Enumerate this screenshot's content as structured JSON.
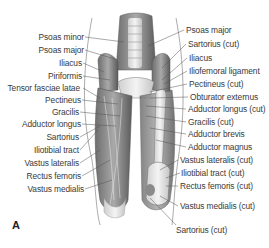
{
  "figure": {
    "panel_label": "A",
    "left_labels": [
      {
        "text": "Psoas minor",
        "y": 37
      },
      {
        "text": "Psoas major",
        "y": 50
      },
      {
        "text": "Iliacus",
        "y": 63
      },
      {
        "text": "Piriformis",
        "y": 76
      },
      {
        "text": "Tensor fasciae latae",
        "y": 88
      },
      {
        "text": "Pectineus",
        "y": 100
      },
      {
        "text": "Gracilis",
        "y": 112
      },
      {
        "text": "Adductor longus",
        "y": 124
      },
      {
        "text": "Sartorius",
        "y": 137
      },
      {
        "text": "Iliotibial tract",
        "y": 150
      },
      {
        "text": "Vastus lateralis",
        "y": 163
      },
      {
        "text": "Rectus femoris",
        "y": 176
      },
      {
        "text": "Vastus medialis",
        "y": 189
      }
    ],
    "right_labels": [
      {
        "text": "Psoas major",
        "y": 30
      },
      {
        "text": "Sartorius (cut)",
        "y": 44
      },
      {
        "text": "Iliacus",
        "y": 58
      },
      {
        "text": "Iliofemoral ligament",
        "y": 71
      },
      {
        "text": "Pectineus (cut)",
        "y": 84
      },
      {
        "text": "Obturator externus",
        "y": 97
      },
      {
        "text": "Adductor longus (cut)",
        "y": 109
      },
      {
        "text": "Gracilis (cut)",
        "y": 122
      },
      {
        "text": "Adductor brevis",
        "y": 134
      },
      {
        "text": "Adductor magnus",
        "y": 147
      },
      {
        "text": "Vastus lateralis (cut)",
        "y": 160
      },
      {
        "text": "Iliotibial tract (cut)",
        "y": 173
      },
      {
        "text": "Rectus femoris (cut)",
        "y": 186
      },
      {
        "text": "Vastus medialis (cut)",
        "y": 206
      },
      {
        "text": "Sartorius (cut)",
        "y": 230
      }
    ]
  }
}
